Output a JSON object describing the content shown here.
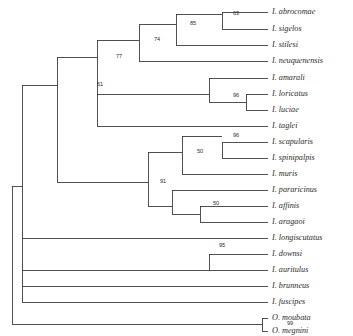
{
  "figure": {
    "type": "phylogenetic-tree",
    "background_color": "#ffffff",
    "branch_color": "#3d3d3d",
    "text_color": "#2b2b2b"
  },
  "chart_data": {
    "type": "tree",
    "title": "",
    "xlabel": "",
    "ylabel": "",
    "layout": "rectangular-cladogram",
    "tip_count": 21,
    "support_count": 12,
    "legend": [],
    "grid": false,
    "tips": [
      {
        "id": "t1",
        "label": "I. abrocomae",
        "x": 272,
        "y": 12
      },
      {
        "id": "t2",
        "label": "I. sigelos",
        "x": 272,
        "y": 29
      },
      {
        "id": "t3",
        "label": "I. stilesi",
        "x": 272,
        "y": 45
      },
      {
        "id": "t4",
        "label": "I. neuquenensis",
        "x": 272,
        "y": 61
      },
      {
        "id": "t5",
        "label": "I. amarali",
        "x": 272,
        "y": 78
      },
      {
        "id": "t6",
        "label": "I. loricatus",
        "x": 272,
        "y": 94
      },
      {
        "id": "t7",
        "label": "I. luciae",
        "x": 272,
        "y": 110
      },
      {
        "id": "t8",
        "label": "I. taglei",
        "x": 272,
        "y": 126
      },
      {
        "id": "t9",
        "label": "I. scapularis",
        "x": 272,
        "y": 142
      },
      {
        "id": "t10",
        "label": "I. spinipalpis",
        "x": 272,
        "y": 158
      },
      {
        "id": "t11",
        "label": "I. muris",
        "x": 272,
        "y": 174
      },
      {
        "id": "t12",
        "label": "I. pararicinus",
        "x": 272,
        "y": 190
      },
      {
        "id": "t13",
        "label": "I. affinis",
        "x": 272,
        "y": 206
      },
      {
        "id": "t14",
        "label": "I. aragaoi",
        "x": 272,
        "y": 222
      },
      {
        "id": "t15",
        "label": "I. longiscutatus",
        "x": 272,
        "y": 238
      },
      {
        "id": "t16",
        "label": "I. downsi",
        "x": 272,
        "y": 254
      },
      {
        "id": "t17",
        "label": "I. auritulus",
        "x": 272,
        "y": 270
      },
      {
        "id": "t18",
        "label": "I. brunneus",
        "x": 272,
        "y": 286
      },
      {
        "id": "t19",
        "label": "I. fuscipes",
        "x": 272,
        "y": 302
      },
      {
        "id": "t20",
        "label": "O. moubata",
        "x": 272,
        "y": 318
      },
      {
        "id": "t21",
        "label": "O. megnini",
        "x": 272,
        "y": 331
      }
    ],
    "support_values": [
      {
        "id": "s63",
        "value": "63",
        "x": 236,
        "y": 14,
        "clade": "abrocomae-sigelos"
      },
      {
        "id": "s85",
        "value": "85",
        "x": 193,
        "y": 24,
        "clade": "abrocomae-sigelos-stilesi"
      },
      {
        "id": "s74",
        "value": "74",
        "x": 157,
        "y": 40,
        "clade": "abrocomae-neuquenensis"
      },
      {
        "id": "s77",
        "value": "77",
        "x": 119,
        "y": 57,
        "clade": "chilean-brazilian-group"
      },
      {
        "id": "s61",
        "value": "61",
        "x": 100,
        "y": 85,
        "clade": "ixodes-core"
      },
      {
        "id": "s96a",
        "value": "96",
        "x": 236,
        "y": 96,
        "clade": "loricatus-luciae"
      },
      {
        "id": "s96b",
        "value": "96",
        "x": 236,
        "y": 136,
        "clade": "scapularis-spinipalpis"
      },
      {
        "id": "s50a",
        "value": "50",
        "x": 200,
        "y": 152,
        "clade": "scapularis-muris"
      },
      {
        "id": "s91",
        "value": "91",
        "x": 163,
        "y": 182,
        "clade": "ricinus-complex"
      },
      {
        "id": "s50b",
        "value": "50",
        "x": 216,
        "y": 204,
        "clade": "affinis-aragaoi"
      },
      {
        "id": "s95",
        "value": "95",
        "x": 222,
        "y": 246,
        "clade": "downsi-auritulus"
      },
      {
        "id": "s99",
        "value": "99",
        "x": 290,
        "y": 324,
        "clade": "ornithodoros-otobius"
      }
    ],
    "branches": [
      {
        "from": "root",
        "to": "node_ixodes",
        "type": "vertical",
        "x": 12,
        "y1": 186,
        "y2": 324
      },
      {
        "from": "root",
        "to": "node_ixodes",
        "type": "horizontal",
        "y": 186,
        "x1": 12,
        "x2": 22
      },
      {
        "from": "root",
        "to": "node_argas",
        "type": "horizontal",
        "y": 324,
        "x1": 12,
        "x2": 262
      }
    ]
  }
}
